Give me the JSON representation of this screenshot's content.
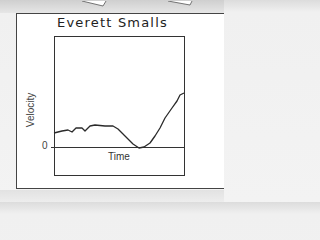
{
  "chart_data": {
    "type": "line",
    "title": "Everett Smalls",
    "xlabel": "Time",
    "ylabel": "Velocity",
    "y_tick_labels": [
      "0"
    ],
    "grid": false,
    "legend": null,
    "series": [
      {
        "name": "Everett Smalls",
        "points_px": [
          [
            54,
            133
          ],
          [
            62,
            131
          ],
          [
            68,
            130
          ],
          [
            72,
            132
          ],
          [
            76,
            128
          ],
          [
            82,
            128
          ],
          [
            85,
            131
          ],
          [
            90,
            126
          ],
          [
            95,
            125
          ],
          [
            105,
            126
          ],
          [
            113,
            126
          ],
          [
            118,
            129
          ],
          [
            125,
            136
          ],
          [
            133,
            144
          ],
          [
            139,
            148
          ],
          [
            144,
            147
          ],
          [
            150,
            143
          ],
          [
            155,
            136
          ],
          [
            160,
            128
          ],
          [
            165,
            118
          ],
          [
            172,
            108
          ],
          [
            177,
            101
          ],
          [
            180,
            95
          ],
          [
            184,
            93
          ]
        ],
        "x": [
          0,
          0.06,
          0.11,
          0.14,
          0.17,
          0.22,
          0.24,
          0.28,
          0.32,
          0.39,
          0.45,
          0.49,
          0.55,
          0.61,
          0.65,
          0.69,
          0.74,
          0.78,
          0.82,
          0.85,
          0.91,
          0.95,
          0.97,
          1.0
        ],
        "values": [
          1.4,
          1.6,
          1.7,
          1.5,
          1.9,
          1.9,
          1.6,
          2.1,
          2.2,
          2.1,
          2.1,
          1.8,
          1.1,
          0.3,
          0.0,
          0.1,
          0.5,
          1.1,
          1.9,
          2.9,
          3.9,
          4.6,
          5.2,
          5.4
        ]
      }
    ]
  },
  "labels": {
    "title": "Everett Smalls",
    "ylabel": "Velocity",
    "xlabel": "Time",
    "zero": "0"
  },
  "colors": {
    "line": "#2a2a2a",
    "frame": "#333333",
    "card": "#ffffff",
    "background": "#ececec"
  }
}
